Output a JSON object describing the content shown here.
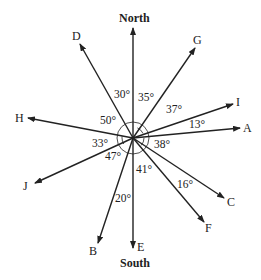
{
  "diagram": {
    "directions": {
      "north": "North",
      "south": "South"
    },
    "vectors": [
      {
        "id": "D",
        "label": "D"
      },
      {
        "id": "G",
        "label": "G"
      },
      {
        "id": "I",
        "label": "I"
      },
      {
        "id": "A",
        "label": "A"
      },
      {
        "id": "H",
        "label": "H"
      },
      {
        "id": "J",
        "label": "J"
      },
      {
        "id": "B",
        "label": "B"
      },
      {
        "id": "E",
        "label": "E"
      },
      {
        "id": "F",
        "label": "F"
      },
      {
        "id": "C",
        "label": "C"
      }
    ],
    "angles": {
      "north_d": "30°",
      "north_g": "35°",
      "g_i": "37°",
      "i_a": "13°",
      "h_d": "50°",
      "h_j": "33°",
      "j_b": "47°",
      "a_c": "38°",
      "b_e": "20°",
      "e_f": "41°",
      "f_c": "16°"
    }
  }
}
